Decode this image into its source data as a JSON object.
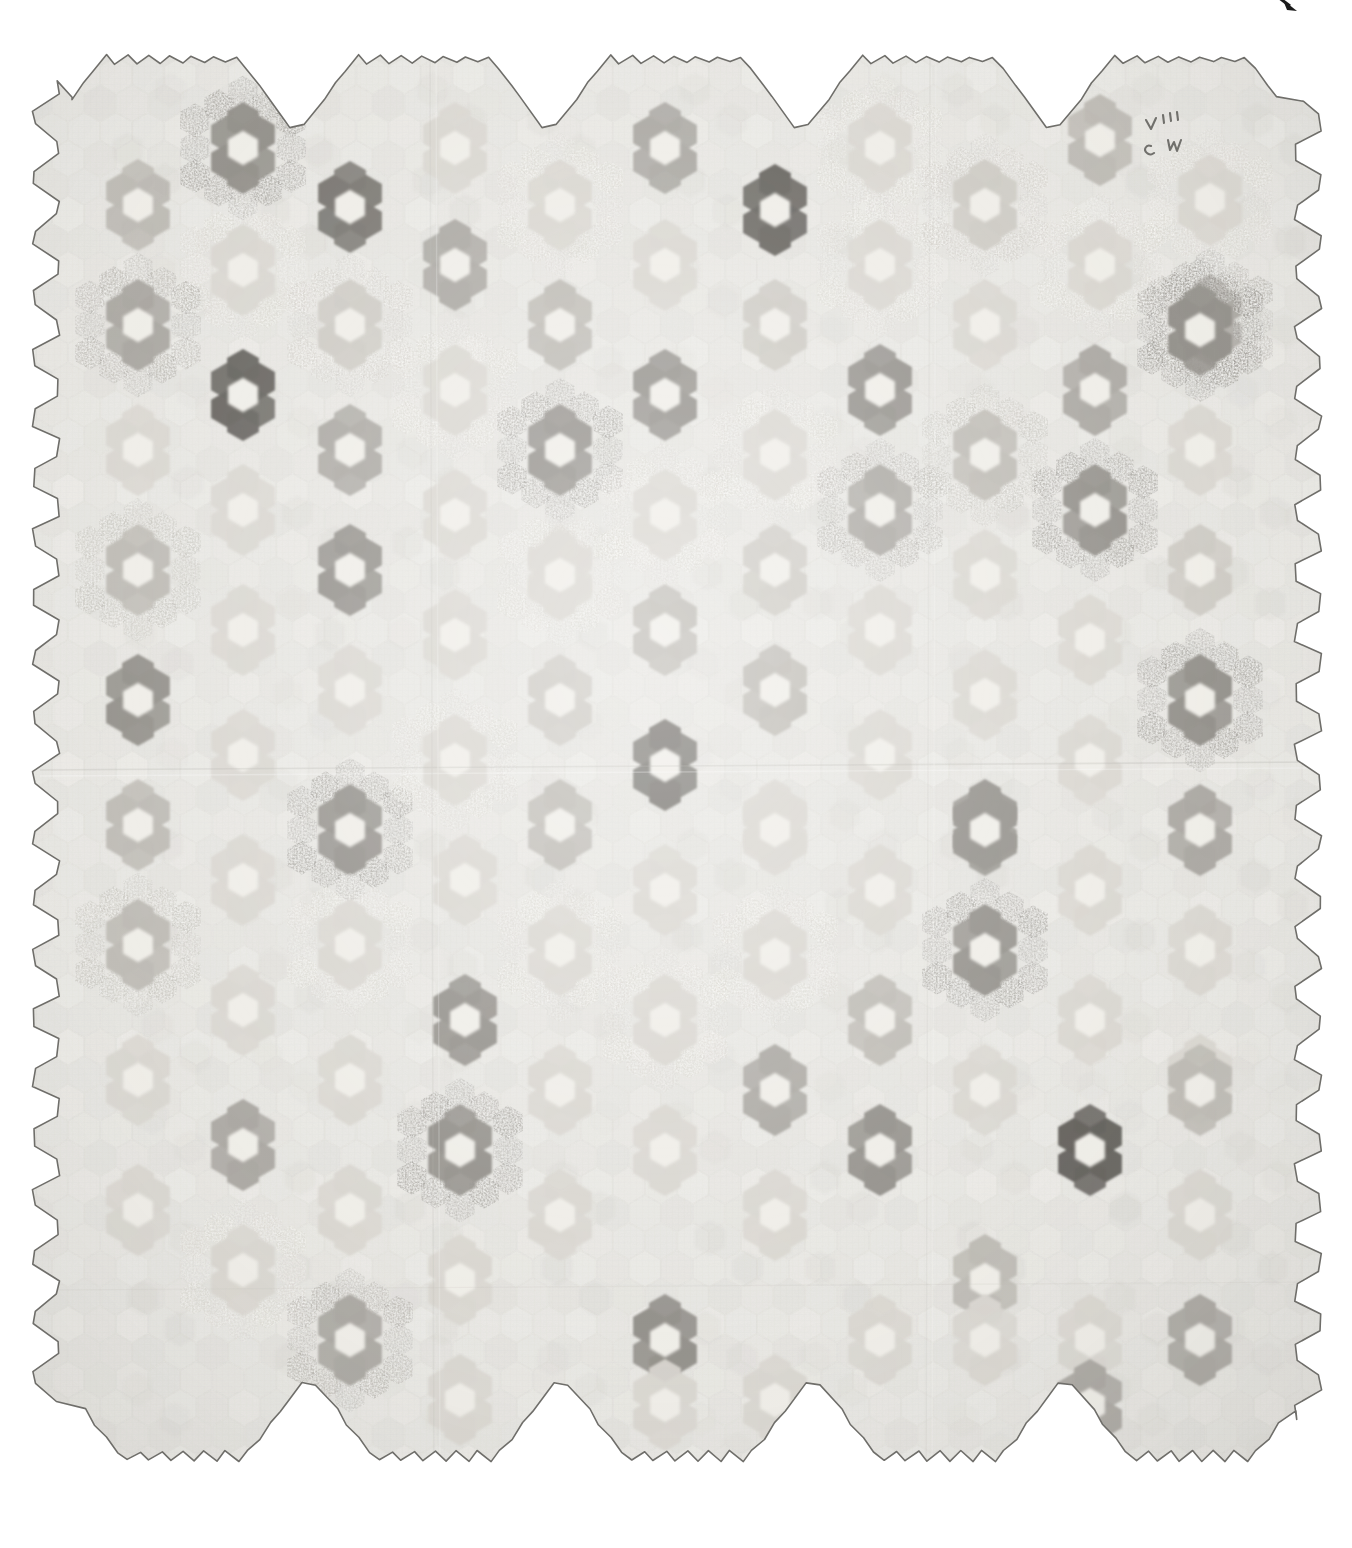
{
  "artifact": {
    "kind": "photograph-of-textile",
    "object_name": "hexagon mosaic patchwork quilt",
    "pattern_name": "Grandmother's Flower Garden",
    "description": "Full overhead photograph of a pieced cotton quilt composed of small hexagonal patches arranged into six-petal rosettes, set on a pale background with a scalloped hexagonal edge.",
    "background_color": "#ffffff"
  },
  "canvas": {
    "width": 1352,
    "height": 1548
  },
  "quilt": {
    "field_color": "#e3e2dd",
    "field_color_alt": "#dcdbd5",
    "edge_outline_color": "#6f6e6a",
    "edge_outline_width": 1.6,
    "bounds": {
      "left": 34,
      "top": 28,
      "right": 1320,
      "bottom": 1520
    },
    "hex_radius": 18.5,
    "column_count": 12,
    "row_count": 13,
    "column_spacing": 105,
    "row_spacing": 120
  },
  "palette": {
    "very_dark": "#585550",
    "dark": "#6e6b65",
    "mid_dark": "#8a8781",
    "mid": "#a3a09a",
    "mid_light": "#b8b5ae",
    "light": "#c9c6bf",
    "very_light": "#d6d3cc",
    "near_field": "#dedbd4",
    "center_light": "#eeece6",
    "mottle": "#b4b1aa"
  },
  "marks": {
    "corner_mark_color": "#1b1b1b",
    "corner_mark_name": "crop-corner-tick",
    "ink_inscription_color": "#4a4945",
    "ink_inscription_name": "handwritten-ink-initials",
    "ink_inscription_text": "A M C W"
  },
  "chart_data": {
    "type": "heatmap",
    "xlabel": "column",
    "ylabel": "row",
    "grid": false,
    "legend": "none",
    "note": "Each entry is one hexagon rosette: cx/cy are pixel centers in the 1352x1548 frame; tone is the petal-ring darkness; ring2 marks rosettes having a visible second outer ring of patches; style 'speck' = printed/dotted calico petals.",
    "tone_scale": [
      "very_light",
      "light",
      "mid_light",
      "mid",
      "mid_dark",
      "dark",
      "very_dark"
    ],
    "rosettes": [
      {
        "cx": 138,
        "cy": 205,
        "tone": "mid_light",
        "ring2": false,
        "style": "plain"
      },
      {
        "cx": 243,
        "cy": 148,
        "tone": "mid_dark",
        "ring2": true,
        "style": "speck"
      },
      {
        "cx": 243,
        "cy": 270,
        "tone": "very_light",
        "ring2": true,
        "style": "speck"
      },
      {
        "cx": 350,
        "cy": 207,
        "tone": "dark",
        "ring2": false,
        "style": "plain"
      },
      {
        "cx": 350,
        "cy": 325,
        "tone": "light",
        "ring2": true,
        "style": "speck"
      },
      {
        "cx": 455,
        "cy": 265,
        "tone": "mid",
        "ring2": false,
        "style": "plain"
      },
      {
        "cx": 455,
        "cy": 148,
        "tone": "very_light",
        "ring2": false,
        "style": "plain"
      },
      {
        "cx": 560,
        "cy": 205,
        "tone": "very_light",
        "ring2": true,
        "style": "speck"
      },
      {
        "cx": 560,
        "cy": 325,
        "tone": "mid_light",
        "ring2": false,
        "style": "plain"
      },
      {
        "cx": 665,
        "cy": 148,
        "tone": "mid",
        "ring2": false,
        "style": "plain"
      },
      {
        "cx": 665,
        "cy": 265,
        "tone": "very_light",
        "ring2": false,
        "style": "plain"
      },
      {
        "cx": 775,
        "cy": 210,
        "tone": "very_dark",
        "ring2": false,
        "style": "plain"
      },
      {
        "cx": 775,
        "cy": 325,
        "tone": "light",
        "ring2": false,
        "style": "plain"
      },
      {
        "cx": 880,
        "cy": 148,
        "tone": "very_light",
        "ring2": true,
        "style": "speck"
      },
      {
        "cx": 880,
        "cy": 265,
        "tone": "very_light",
        "ring2": true,
        "style": "speck"
      },
      {
        "cx": 985,
        "cy": 205,
        "tone": "light",
        "ring2": true,
        "style": "speck"
      },
      {
        "cx": 985,
        "cy": 325,
        "tone": "very_light",
        "ring2": false,
        "style": "plain"
      },
      {
        "cx": 1100,
        "cy": 140,
        "tone": "mid_light",
        "ring2": false,
        "style": "plain"
      },
      {
        "cx": 1100,
        "cy": 265,
        "tone": "very_light",
        "ring2": true,
        "style": "speck"
      },
      {
        "cx": 1210,
        "cy": 200,
        "tone": "very_light",
        "ring2": true,
        "style": "speck"
      },
      {
        "cx": 1210,
        "cy": 320,
        "tone": "mid",
        "ring2": true,
        "style": "speck"
      },
      {
        "cx": 138,
        "cy": 325,
        "tone": "mid",
        "ring2": true,
        "style": "speck"
      },
      {
        "cx": 138,
        "cy": 450,
        "tone": "very_light",
        "ring2": false,
        "style": "plain"
      },
      {
        "cx": 243,
        "cy": 395,
        "tone": "very_dark",
        "ring2": false,
        "style": "plain"
      },
      {
        "cx": 243,
        "cy": 510,
        "tone": "very_light",
        "ring2": false,
        "style": "plain"
      },
      {
        "cx": 350,
        "cy": 450,
        "tone": "mid",
        "ring2": false,
        "style": "plain"
      },
      {
        "cx": 350,
        "cy": 570,
        "tone": "mid_dark",
        "ring2": false,
        "style": "plain"
      },
      {
        "cx": 455,
        "cy": 390,
        "tone": "very_light",
        "ring2": true,
        "style": "speck"
      },
      {
        "cx": 455,
        "cy": 515,
        "tone": "very_light",
        "ring2": false,
        "style": "plain"
      },
      {
        "cx": 560,
        "cy": 450,
        "tone": "mid_dark",
        "ring2": true,
        "style": "speck"
      },
      {
        "cx": 560,
        "cy": 570,
        "tone": "very_light",
        "ring2": false,
        "style": "plain"
      },
      {
        "cx": 665,
        "cy": 395,
        "tone": "mid_dark",
        "ring2": false,
        "style": "plain"
      },
      {
        "cx": 665,
        "cy": 515,
        "tone": "very_light",
        "ring2": true,
        "style": "speck"
      },
      {
        "cx": 775,
        "cy": 455,
        "tone": "very_light",
        "ring2": true,
        "style": "speck"
      },
      {
        "cx": 775,
        "cy": 570,
        "tone": "light",
        "ring2": false,
        "style": "plain"
      },
      {
        "cx": 880,
        "cy": 390,
        "tone": "mid_dark",
        "ring2": false,
        "style": "plain"
      },
      {
        "cx": 880,
        "cy": 510,
        "tone": "mid",
        "ring2": true,
        "style": "speck"
      },
      {
        "cx": 985,
        "cy": 455,
        "tone": "mid_light",
        "ring2": true,
        "style": "speck"
      },
      {
        "cx": 985,
        "cy": 575,
        "tone": "very_light",
        "ring2": false,
        "style": "plain"
      },
      {
        "cx": 1095,
        "cy": 390,
        "tone": "mid",
        "ring2": false,
        "style": "plain"
      },
      {
        "cx": 1095,
        "cy": 510,
        "tone": "mid_dark",
        "ring2": true,
        "style": "speck"
      },
      {
        "cx": 1200,
        "cy": 330,
        "tone": "mid_dark",
        "ring2": true,
        "style": "speck"
      },
      {
        "cx": 1200,
        "cy": 450,
        "tone": "very_light",
        "ring2": false,
        "style": "plain"
      },
      {
        "cx": 1200,
        "cy": 570,
        "tone": "light",
        "ring2": false,
        "style": "plain"
      },
      {
        "cx": 138,
        "cy": 570,
        "tone": "mid_light",
        "ring2": true,
        "style": "speck"
      },
      {
        "cx": 138,
        "cy": 700,
        "tone": "mid_dark",
        "ring2": false,
        "style": "plain"
      },
      {
        "cx": 243,
        "cy": 630,
        "tone": "very_light",
        "ring2": false,
        "style": "plain"
      },
      {
        "cx": 243,
        "cy": 755,
        "tone": "very_light",
        "ring2": false,
        "style": "plain"
      },
      {
        "cx": 350,
        "cy": 690,
        "tone": "very_light",
        "ring2": false,
        "style": "plain"
      },
      {
        "cx": 350,
        "cy": 830,
        "tone": "mid_dark",
        "ring2": true,
        "style": "speck"
      },
      {
        "cx": 455,
        "cy": 635,
        "tone": "very_light",
        "ring2": false,
        "style": "plain"
      },
      {
        "cx": 455,
        "cy": 760,
        "tone": "very_light",
        "ring2": true,
        "style": "speck"
      },
      {
        "cx": 560,
        "cy": 575,
        "tone": "very_light",
        "ring2": true,
        "style": "speck"
      },
      {
        "cx": 560,
        "cy": 700,
        "tone": "light",
        "ring2": false,
        "style": "plain"
      },
      {
        "cx": 665,
        "cy": 630,
        "tone": "mid_light",
        "ring2": false,
        "style": "plain"
      },
      {
        "cx": 665,
        "cy": 765,
        "tone": "dark",
        "ring2": false,
        "style": "plain"
      },
      {
        "cx": 775,
        "cy": 690,
        "tone": "mid_light",
        "ring2": false,
        "style": "plain"
      },
      {
        "cx": 775,
        "cy": 825,
        "tone": "very_light",
        "ring2": false,
        "style": "plain"
      },
      {
        "cx": 880,
        "cy": 630,
        "tone": "very_light",
        "ring2": false,
        "style": "plain"
      },
      {
        "cx": 880,
        "cy": 755,
        "tone": "very_light",
        "ring2": false,
        "style": "plain"
      },
      {
        "cx": 985,
        "cy": 695,
        "tone": "very_light",
        "ring2": false,
        "style": "plain"
      },
      {
        "cx": 985,
        "cy": 825,
        "tone": "mid_dark",
        "ring2": false,
        "style": "plain"
      },
      {
        "cx": 1090,
        "cy": 640,
        "tone": "very_light",
        "ring2": false,
        "style": "plain"
      },
      {
        "cx": 1090,
        "cy": 760,
        "tone": "very_light",
        "ring2": false,
        "style": "plain"
      },
      {
        "cx": 1200,
        "cy": 700,
        "tone": "mid_dark",
        "ring2": true,
        "style": "speck"
      },
      {
        "cx": 1200,
        "cy": 830,
        "tone": "mid",
        "ring2": false,
        "style": "plain"
      },
      {
        "cx": 138,
        "cy": 825,
        "tone": "mid_light",
        "ring2": false,
        "style": "plain"
      },
      {
        "cx": 138,
        "cy": 945,
        "tone": "mid_light",
        "ring2": true,
        "style": "speck"
      },
      {
        "cx": 243,
        "cy": 880,
        "tone": "very_light",
        "ring2": false,
        "style": "plain"
      },
      {
        "cx": 243,
        "cy": 1010,
        "tone": "very_light",
        "ring2": false,
        "style": "plain"
      },
      {
        "cx": 350,
        "cy": 945,
        "tone": "very_light",
        "ring2": true,
        "style": "speck"
      },
      {
        "cx": 350,
        "cy": 1080,
        "tone": "very_light",
        "ring2": false,
        "style": "plain"
      },
      {
        "cx": 465,
        "cy": 1020,
        "tone": "mid_dark",
        "ring2": false,
        "style": "plain"
      },
      {
        "cx": 465,
        "cy": 880,
        "tone": "very_light",
        "ring2": false,
        "style": "plain"
      },
      {
        "cx": 560,
        "cy": 825,
        "tone": "mid_light",
        "ring2": false,
        "style": "plain"
      },
      {
        "cx": 560,
        "cy": 950,
        "tone": "very_light",
        "ring2": true,
        "style": "speck"
      },
      {
        "cx": 665,
        "cy": 890,
        "tone": "very_light",
        "ring2": false,
        "style": "plain"
      },
      {
        "cx": 665,
        "cy": 1020,
        "tone": "very_light",
        "ring2": true,
        "style": "speck"
      },
      {
        "cx": 775,
        "cy": 830,
        "tone": "very_light",
        "ring2": false,
        "style": "plain"
      },
      {
        "cx": 775,
        "cy": 955,
        "tone": "very_light",
        "ring2": true,
        "style": "speck"
      },
      {
        "cx": 880,
        "cy": 890,
        "tone": "very_light",
        "ring2": false,
        "style": "plain"
      },
      {
        "cx": 880,
        "cy": 1020,
        "tone": "mid_light",
        "ring2": false,
        "style": "plain"
      },
      {
        "cx": 985,
        "cy": 830,
        "tone": "mid_dark",
        "ring2": false,
        "style": "plain"
      },
      {
        "cx": 985,
        "cy": 950,
        "tone": "mid_dark",
        "ring2": true,
        "style": "speck"
      },
      {
        "cx": 1090,
        "cy": 890,
        "tone": "very_light",
        "ring2": false,
        "style": "plain"
      },
      {
        "cx": 1090,
        "cy": 1020,
        "tone": "very_light",
        "ring2": false,
        "style": "plain"
      },
      {
        "cx": 1200,
        "cy": 950,
        "tone": "very_light",
        "ring2": false,
        "style": "plain"
      },
      {
        "cx": 1200,
        "cy": 1080,
        "tone": "very_light",
        "ring2": false,
        "style": "plain"
      },
      {
        "cx": 138,
        "cy": 1080,
        "tone": "very_light",
        "ring2": false,
        "style": "plain"
      },
      {
        "cx": 138,
        "cy": 1210,
        "tone": "very_light",
        "ring2": false,
        "style": "plain"
      },
      {
        "cx": 243,
        "cy": 1145,
        "tone": "mid",
        "ring2": false,
        "style": "plain"
      },
      {
        "cx": 243,
        "cy": 1270,
        "tone": "very_light",
        "ring2": true,
        "style": "speck"
      },
      {
        "cx": 350,
        "cy": 1210,
        "tone": "very_light",
        "ring2": false,
        "style": "plain"
      },
      {
        "cx": 350,
        "cy": 1340,
        "tone": "mid",
        "ring2": true,
        "style": "speck"
      },
      {
        "cx": 460,
        "cy": 1150,
        "tone": "mid_dark",
        "ring2": true,
        "style": "speck"
      },
      {
        "cx": 460,
        "cy": 1280,
        "tone": "very_light",
        "ring2": false,
        "style": "plain"
      },
      {
        "cx": 460,
        "cy": 1400,
        "tone": "very_light",
        "ring2": false,
        "style": "plain"
      },
      {
        "cx": 560,
        "cy": 1090,
        "tone": "very_light",
        "ring2": false,
        "style": "plain"
      },
      {
        "cx": 560,
        "cy": 1215,
        "tone": "very_light",
        "ring2": false,
        "style": "plain"
      },
      {
        "cx": 665,
        "cy": 1150,
        "tone": "very_light",
        "ring2": false,
        "style": "plain"
      },
      {
        "cx": 665,
        "cy": 1340,
        "tone": "mid_dark",
        "ring2": false,
        "style": "plain"
      },
      {
        "cx": 665,
        "cy": 1405,
        "tone": "very_light",
        "ring2": false,
        "style": "plain"
      },
      {
        "cx": 775,
        "cy": 1090,
        "tone": "mid",
        "ring2": false,
        "style": "plain"
      },
      {
        "cx": 775,
        "cy": 1215,
        "tone": "very_light",
        "ring2": false,
        "style": "plain"
      },
      {
        "cx": 775,
        "cy": 1400,
        "tone": "very_light",
        "ring2": false,
        "style": "plain"
      },
      {
        "cx": 880,
        "cy": 1150,
        "tone": "mid_dark",
        "ring2": false,
        "style": "plain"
      },
      {
        "cx": 880,
        "cy": 1340,
        "tone": "very_light",
        "ring2": false,
        "style": "plain"
      },
      {
        "cx": 985,
        "cy": 1090,
        "tone": "very_light",
        "ring2": false,
        "style": "plain"
      },
      {
        "cx": 985,
        "cy": 1280,
        "tone": "mid_light",
        "ring2": false,
        "style": "plain"
      },
      {
        "cx": 985,
        "cy": 1340,
        "tone": "very_light",
        "ring2": false,
        "style": "plain"
      },
      {
        "cx": 1090,
        "cy": 1150,
        "tone": "very_dark",
        "ring2": false,
        "style": "plain"
      },
      {
        "cx": 1090,
        "cy": 1340,
        "tone": "very_light",
        "ring2": false,
        "style": "plain"
      },
      {
        "cx": 1090,
        "cy": 1405,
        "tone": "mid",
        "ring2": false,
        "style": "plain"
      },
      {
        "cx": 1200,
        "cy": 1090,
        "tone": "mid_light",
        "ring2": false,
        "style": "plain"
      },
      {
        "cx": 1200,
        "cy": 1215,
        "tone": "very_light",
        "ring2": false,
        "style": "plain"
      },
      {
        "cx": 1200,
        "cy": 1340,
        "tone": "mid",
        "ring2": false,
        "style": "plain"
      }
    ]
  }
}
